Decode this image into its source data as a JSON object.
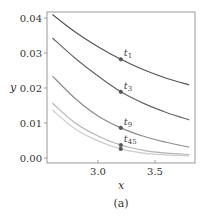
{
  "chart_data": {
    "type": "line",
    "title": "",
    "caption": "(a)",
    "xlabel": "x",
    "ylabel": "y",
    "xlim": [
      2.55,
      3.85
    ],
    "ylim": [
      -0.0015,
      0.0415
    ],
    "xticks": [
      3.0,
      3.5
    ],
    "xtick_labels": [
      "3.0",
      "3.5"
    ],
    "yticks": [
      0.0,
      0.01,
      0.02,
      0.03,
      0.04
    ],
    "ytick_labels": [
      "0.00",
      "0.01",
      "0.02",
      "0.03",
      "0.04"
    ],
    "grid": false,
    "legend": null,
    "x": [
      2.6,
      2.8,
      3.0,
      3.2,
      3.4,
      3.6,
      3.8
    ],
    "series": [
      {
        "name": "t1",
        "color": "#555555",
        "values": [
          0.041,
          0.036,
          0.0318,
          0.0282,
          0.0252,
          0.0228,
          0.0209
        ]
      },
      {
        "name": "t3",
        "color": "#666666",
        "values": [
          0.0343,
          0.0285,
          0.0234,
          0.0189,
          0.0156,
          0.013,
          0.0109
        ]
      },
      {
        "name": "t9",
        "color": "#8c8c8c",
        "values": [
          0.0234,
          0.017,
          0.012,
          0.0086,
          0.0062,
          0.0045,
          0.0031
        ]
      },
      {
        "name": "t45a",
        "color": "#b5b5b5",
        "values": [
          0.0157,
          0.01,
          0.0063,
          0.0037,
          0.0022,
          0.0014,
          0.001
        ]
      },
      {
        "name": "t45b",
        "color": "#cccccc",
        "values": [
          0.0137,
          0.0083,
          0.0049,
          0.0026,
          0.0014,
          0.0009,
          0.0006
        ]
      }
    ],
    "markers": [
      {
        "label": "t",
        "sub": "1",
        "x": 3.2,
        "y": 0.0282
      },
      {
        "label": "t",
        "sub": "3",
        "x": 3.2,
        "y": 0.0189
      },
      {
        "label": "t",
        "sub": "9",
        "x": 3.2,
        "y": 0.0086
      },
      {
        "label": "t",
        "sub": "45",
        "x": 3.2,
        "y": 0.0037
      },
      {
        "label": "",
        "sub": "",
        "x": 3.2,
        "y": 0.0026
      }
    ],
    "axis_color": "#999999",
    "marker_color": "#555555"
  }
}
